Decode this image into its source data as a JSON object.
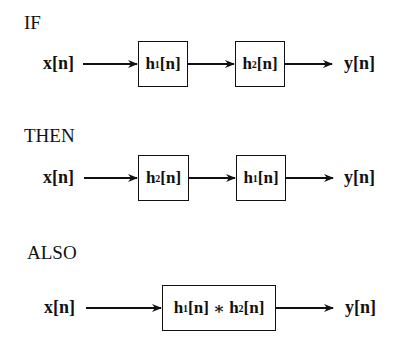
{
  "diagrams": [
    {
      "heading": "IF",
      "input": "x[n]",
      "blocks": [
        {
          "base": "h",
          "sub": "1",
          "arg": "[n]"
        },
        {
          "base": "h",
          "sub": "2",
          "arg": "[n]"
        }
      ],
      "output": "y[n]"
    },
    {
      "heading": "THEN",
      "input": "x[n]",
      "blocks": [
        {
          "base": "h",
          "sub": "2",
          "arg": "[n]"
        },
        {
          "base": "h",
          "sub": "1",
          "arg": "[n]"
        }
      ],
      "output": "y[n]"
    },
    {
      "heading": "ALSO",
      "input": "x[n]",
      "blocks": [
        {
          "base": "h",
          "sub": "1",
          "arg": "[n]",
          "op": " ∗ ",
          "base2": "h",
          "sub2": "2",
          "arg2": "[n]"
        }
      ],
      "output": "y[n]"
    }
  ]
}
